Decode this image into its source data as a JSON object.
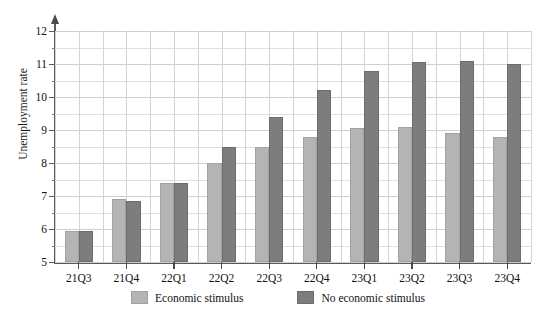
{
  "figure": {
    "clipped_top_text": "— — —"
  },
  "chart_data": {
    "type": "bar",
    "title": "",
    "xlabel": "",
    "ylabel": "Unemployment rate",
    "categories": [
      "21Q3",
      "21Q4",
      "22Q1",
      "22Q2",
      "22Q3",
      "22Q4",
      "23Q1",
      "23Q2",
      "23Q3",
      "23Q4"
    ],
    "series": [
      {
        "name": "Economic stimulus",
        "color": "#b4b4b4",
        "values": [
          5.95,
          6.9,
          7.4,
          8.0,
          8.5,
          8.8,
          9.05,
          9.1,
          8.9,
          8.8
        ]
      },
      {
        "name": "No economic stimulus",
        "color": "#7d7d7d",
        "values": [
          5.95,
          6.85,
          7.4,
          8.5,
          9.4,
          10.2,
          10.8,
          11.05,
          11.1,
          11.0
        ]
      }
    ],
    "ylim": [
      5,
      12
    ],
    "ytick_values": [
      5,
      6,
      7,
      8,
      9,
      10,
      11,
      12
    ],
    "ytick_labels": [
      "5",
      "6",
      "7",
      "8",
      "9",
      "10",
      "11",
      "12"
    ],
    "yminor_step": 0.5,
    "grid": true,
    "grid_axis": "both",
    "legend_position": "bottom-center",
    "legend": [
      {
        "label": "Economic stimulus",
        "color": "#b4b4b4"
      },
      {
        "label": "No economic stimulus",
        "color": "#7d7d7d"
      }
    ]
  }
}
